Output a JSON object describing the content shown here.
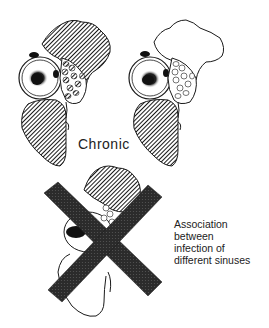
{
  "labels": {
    "chronic": "Chronic",
    "association_lines": [
      "Association",
      "between",
      "infection of",
      "different sinuses"
    ]
  },
  "panels": [
    {
      "id": "left",
      "description": "Chronic sinusitis: frontal and maxillary sinuses shaded, ethmoid cells shaded"
    },
    {
      "id": "right",
      "description": "Chronic sinusitis: frontal sinus clear, maxillary shaded, ethmoid cells clear"
    },
    {
      "id": "bottom",
      "description": "Combined sinus diagram crossed out"
    }
  ],
  "colors": {
    "ink": "#1a1a1a",
    "hatch": "#2a2a2a",
    "cross": "#2b2b2b",
    "background": "#ffffff"
  }
}
